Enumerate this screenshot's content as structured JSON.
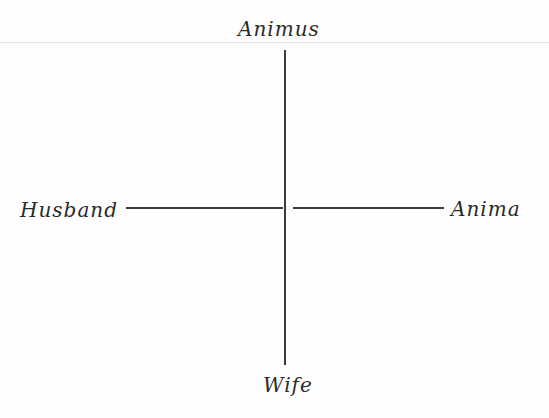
{
  "diagram": {
    "type": "cross-axis",
    "labels": {
      "top": "Animus",
      "left": "Husband",
      "right": "Anima",
      "bottom": "Wife"
    },
    "colors": {
      "ink": "#2a2a2a",
      "line": "#3a3a3a",
      "background": "#fefefe"
    }
  }
}
